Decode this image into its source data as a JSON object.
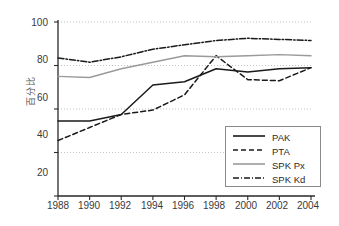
{
  "chart_data": {
    "type": "line",
    "title": "",
    "xlabel": "",
    "ylabel": "百分比",
    "x": [
      1988,
      1990,
      1992,
      1994,
      1996,
      1998,
      2000,
      2002,
      2004
    ],
    "xlim": [
      1988,
      2004
    ],
    "ylim": [
      20,
      100
    ],
    "xticks": [
      "1988",
      "1990",
      "1992",
      "1994",
      "1996",
      "1998",
      "2000",
      "2002",
      "2004"
    ],
    "yticks": [
      "20",
      "40",
      "60",
      "80",
      "100"
    ],
    "grid": "horizontal-dotted",
    "legend_position": "lower-right",
    "series": [
      {
        "name": "PAK",
        "style": "solid",
        "color": "#1a1a1a",
        "values": [
          54.5,
          54.5,
          57.5,
          71.0,
          72.5,
          78.5,
          77.0,
          78.5,
          79.0
        ]
      },
      {
        "name": "PTA",
        "style": "dashed",
        "color": "#1a1a1a",
        "values": [
          45.5,
          51.5,
          57.5,
          59.5,
          66.5,
          84.5,
          73.5,
          73.0,
          79.0
        ]
      },
      {
        "name": "SPK Px",
        "style": "solid",
        "color": "#9a9a9a",
        "values": [
          75.0,
          74.5,
          78.5,
          81.5,
          84.5,
          84.0,
          84.5,
          85.0,
          84.5
        ]
      },
      {
        "name": "SPK Kd",
        "style": "dash-dot",
        "color": "#1a1a1a",
        "values": [
          83.5,
          81.5,
          84.0,
          87.5,
          89.5,
          91.5,
          92.5,
          92.0,
          91.5
        ]
      }
    ]
  },
  "legend": {
    "entries": [
      {
        "label": "PAK"
      },
      {
        "label": "PTA"
      },
      {
        "label": "SPK Px"
      },
      {
        "label": "SPK Kd"
      }
    ]
  },
  "axes": {
    "y_title": "百分比",
    "y_labels": [
      "100",
      "80",
      "60",
      "40",
      "20"
    ],
    "x_labels": [
      "1988",
      "1990",
      "1992",
      "1994",
      "1996",
      "1998",
      "2000",
      "2002",
      "2004"
    ]
  }
}
